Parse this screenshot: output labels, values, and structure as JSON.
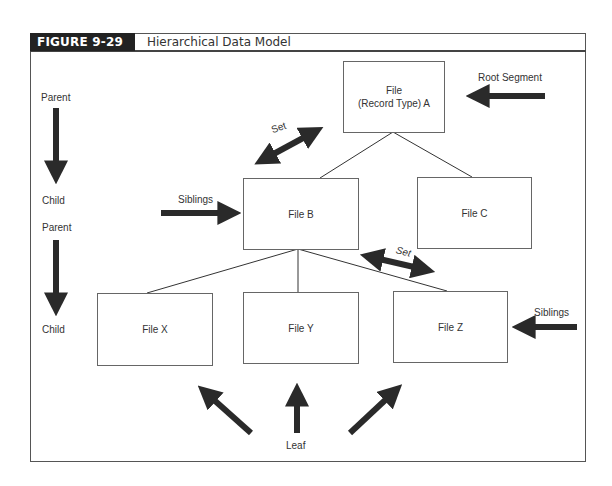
{
  "figure": {
    "label": "FIGURE 9-29",
    "title": "Hierarchical Data Model"
  },
  "nodes": {
    "root": {
      "line1": "File",
      "line2": "(Record Type) A"
    },
    "b": "File B",
    "c": "File C",
    "x": "File X",
    "y": "File Y",
    "z": "File Z"
  },
  "annotations": {
    "root_segment": "Root Segment",
    "set_upper": "Set",
    "set_lower": "Set",
    "siblings_left": "Siblings",
    "siblings_right": "Siblings",
    "leaf": "Leaf"
  },
  "legend": {
    "parent_1": "Parent",
    "child_1": "Child",
    "parent_2": "Parent",
    "child_2": "Child"
  },
  "colors": {
    "arrow": "#2a2a2a",
    "line": "#333333",
    "header_bg": "#222222"
  }
}
